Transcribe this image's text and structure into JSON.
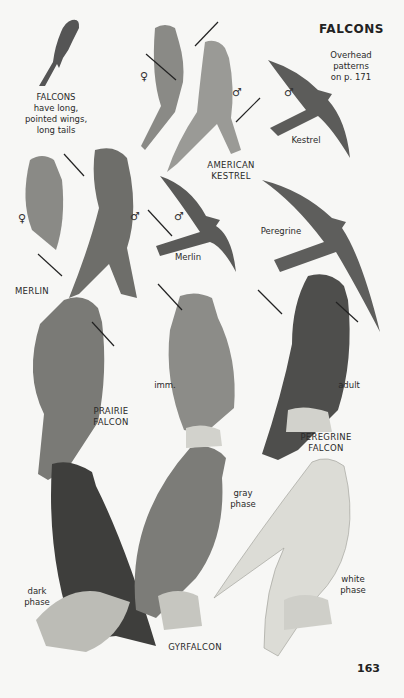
{
  "page": {
    "title": "FALCONS",
    "page_number": "163",
    "cross_reference": "Overhead\npatterns\non p. 171",
    "intro_caption": "FALCONS\nhave long,\npointed wings,\nlong tails"
  },
  "species": {
    "american_kestrel": "AMERICAN\nKESTREL",
    "merlin": "MERLIN",
    "prairie_falcon": "PRAIRIE\nFALCON",
    "peregrine_falcon": "PEREGRINE\nFALCON",
    "gyrfalcon": "GYRFALCON"
  },
  "flight_labels": {
    "kestrel": "Kestrel",
    "merlin": "Merlin",
    "peregrine": "Peregrine"
  },
  "phase_labels": {
    "immature": "imm.",
    "adult": "adult",
    "gray_phase": "gray\nphase",
    "dark_phase": "dark\nphase",
    "white_phase": "white\nphase"
  },
  "sex_symbols": {
    "female": "♀",
    "male": "♂"
  }
}
